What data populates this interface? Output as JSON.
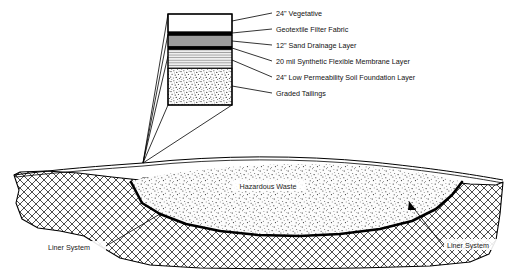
{
  "figure": {
    "background_color": "#ffffff",
    "line_color": "#000000"
  },
  "callout": {
    "name": "cap-profile-column",
    "layers": [
      {
        "key": "vegetative",
        "label": "24\" Vegetative",
        "fill": "#ffffff",
        "pattern": "solid"
      },
      {
        "key": "geotextile",
        "label": "Geotextile Filter Fabric",
        "fill": "#000000",
        "pattern": "solid"
      },
      {
        "key": "sand-drainage",
        "label": "12\" Sand Drainage Layer",
        "fill": "#9c9c9c",
        "pattern": "solid"
      },
      {
        "key": "synthetic-membrane",
        "label": "20 mil Synthetic Flexible Membrane Layer",
        "fill": "#000000",
        "pattern": "solid"
      },
      {
        "key": "soil-foundation",
        "label": "24\" Low Permeability Soil Foundation Layer",
        "fill": "#ededed",
        "pattern": "horizontal-lines"
      },
      {
        "key": "graded-tailings",
        "label": "Graded Tailings",
        "fill": "#fbfbfb",
        "pattern": "speckle"
      }
    ]
  },
  "cross_section": {
    "waste_label": "Hazardous Waste",
    "waste_fill": "#f7f7f7",
    "waste_pattern": "speckle",
    "ground_pattern": "cross-hatch",
    "ground_fill": "#ffffff",
    "liner_labels": [
      {
        "key": "liner-left",
        "label": "Liner System"
      },
      {
        "key": "liner-right",
        "label": "Liner System"
      }
    ]
  }
}
